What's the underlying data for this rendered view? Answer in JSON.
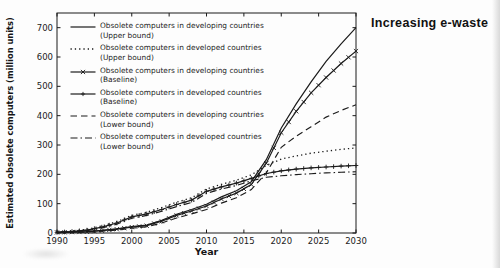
{
  "page": {
    "background_color": "#fdfdfd",
    "ink_color": "#1b1b1b"
  },
  "chart_data": {
    "type": "line",
    "title": "Increasing e-waste",
    "xlabel": "Year",
    "ylabel": "Estimated obsolete computers (million units)",
    "xlim": [
      1990,
      2030
    ],
    "ylim": [
      0,
      750
    ],
    "x_ticks": [
      1990,
      1995,
      2000,
      2005,
      2010,
      2015,
      2020,
      2025,
      2030
    ],
    "y_ticks": [
      0,
      100,
      200,
      300,
      400,
      500,
      600,
      700
    ],
    "grid": false,
    "legend_position": "upper-left-inside",
    "x": [
      1990,
      1992,
      1994,
      1996,
      1998,
      2000,
      2002,
      2004,
      2006,
      2008,
      2010,
      2012,
      2014,
      2016,
      2018,
      2020,
      2022,
      2024,
      2026,
      2028,
      2030
    ],
    "series": [
      {
        "key": "developing-upper",
        "legend_line1": "Obsolete computers in developing countries",
        "legend_line2": "(Upper bound)",
        "line": "solid",
        "marker": "none",
        "color": "#1b1b1b",
        "values": [
          2,
          3,
          5,
          9,
          14,
          22,
          27,
          43,
          64,
          80,
          98,
          123,
          144,
          175,
          250,
          358,
          440,
          515,
          585,
          645,
          700
        ]
      },
      {
        "key": "developed-upper",
        "legend_line1": "Obsolete computers in developed countries",
        "legend_line2": "(Upper bound)",
        "line": "dotted",
        "marker": "none",
        "color": "#1b1b1b",
        "values": [
          3,
          7,
          13,
          24,
          39,
          60,
          71,
          87,
          105,
          120,
          150,
          166,
          180,
          198,
          230,
          252,
          263,
          272,
          279,
          285,
          290
        ]
      },
      {
        "key": "developing-baseline",
        "legend_line1": "Obsolete computers in developing countries",
        "legend_line2": "(Baseline)",
        "line": "solid",
        "marker": "x",
        "color": "#1b1b1b",
        "values": [
          2,
          3,
          4,
          8,
          13,
          20,
          25,
          40,
          60,
          75,
          92,
          116,
          136,
          165,
          238,
          342,
          415,
          478,
          530,
          578,
          620
        ]
      },
      {
        "key": "developed-baseline",
        "legend_line1": "Obsolete computers in developed countries",
        "legend_line2": "(Baseline)",
        "line": "solid",
        "marker": "plus",
        "color": "#1b1b1b",
        "values": [
          2,
          5,
          10,
          20,
          34,
          55,
          65,
          80,
          97,
          112,
          142,
          157,
          170,
          186,
          203,
          212,
          218,
          222,
          225,
          228,
          230
        ]
      },
      {
        "key": "developing-lower",
        "legend_line1": "Obsolete computers in developing countries",
        "legend_line2": "(Lower bound)",
        "line": "dashed",
        "marker": "none",
        "color": "#1b1b1b",
        "values": [
          1,
          2,
          3,
          6,
          10,
          16,
          21,
          34,
          51,
          65,
          80,
          102,
          120,
          148,
          205,
          292,
          330,
          362,
          395,
          418,
          437
        ]
      },
      {
        "key": "developed-lower",
        "legend_line1": "Obsolete computers in developed countries",
        "legend_line2": "(Lower bound)",
        "line": "dashdot",
        "marker": "none",
        "color": "#1b1b1b",
        "values": [
          2,
          4,
          8,
          17,
          30,
          50,
          60,
          74,
          90,
          104,
          135,
          150,
          162,
          178,
          190,
          195,
          199,
          202,
          205,
          207,
          209
        ]
      }
    ]
  }
}
